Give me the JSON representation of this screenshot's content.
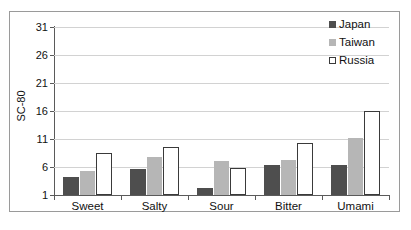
{
  "chart_data": {
    "type": "bar",
    "title": "",
    "subtitle": "",
    "xlabel": "",
    "ylabel": "SC-80",
    "categories": [
      "Sweet",
      "Salty",
      "Sour",
      "Bitter",
      "Umami"
    ],
    "series": [
      {
        "name": "Japan",
        "color": "#4e4e4e",
        "values": [
          4.2,
          5.7,
          2.3,
          6.4,
          6.4
        ]
      },
      {
        "name": "Taiwan",
        "color": "#b6b6b6",
        "values": [
          5.3,
          7.7,
          7.0,
          7.3,
          11.1
        ]
      },
      {
        "name": "Russia",
        "color": "#ffffff",
        "values": [
          8.5,
          9.6,
          5.8,
          10.2,
          16.0
        ]
      }
    ],
    "ylim": [
      1,
      31
    ],
    "yticks": [
      1,
      6,
      11,
      16,
      21,
      26,
      31
    ],
    "ytick_labels": [
      "1",
      "6",
      "11",
      "16",
      "21",
      "26",
      "31"
    ],
    "grid": true,
    "grid_axis": "y",
    "legend_position": "top-right",
    "legend_entries": [
      "Japan",
      "Taiwan",
      "Russia"
    ]
  },
  "axes": {
    "y_title": "SC-80",
    "y_tick_labels": [
      "31",
      "26",
      "21",
      "16",
      "11",
      "6",
      "1"
    ],
    "x_tick_labels": [
      "Sweet",
      "Salty",
      "Sour",
      "Bitter",
      "Umami"
    ]
  },
  "legend": {
    "items": [
      {
        "label": "Japan",
        "swatch": "filled-dark-gray-square"
      },
      {
        "label": "Taiwan",
        "swatch": "filled-light-gray-square"
      },
      {
        "label": "Russia",
        "swatch": "outlined-white-square"
      }
    ]
  },
  "colors": {
    "japan": "#4e4e4e",
    "taiwan": "#b6b6b6",
    "russia_fill": "#ffffff",
    "russia_border": "#3a3a3a",
    "gridline": "#d2d2d2",
    "axis": "#5a5a5a",
    "frame": "#9a9a9a",
    "text": "#111111",
    "background": "#ffffff"
  }
}
